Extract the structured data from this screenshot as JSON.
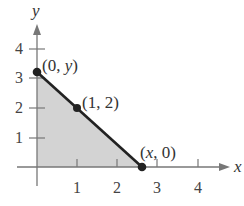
{
  "diagram": {
    "axes": {
      "x_label": "x",
      "y_label": "y",
      "x_ticks": [
        "1",
        "2",
        "3",
        "4"
      ],
      "y_ticks": [
        "1",
        "2",
        "3",
        "4"
      ]
    },
    "points": [
      {
        "label_pre": "(0, ",
        "label_var": "y",
        "label_post": ")",
        "x": 0,
        "y": 3.2
      },
      {
        "label": "(1, 2)",
        "x": 1,
        "y": 2
      },
      {
        "label_pre": "(",
        "label_var": "x",
        "label_post": ", 0)",
        "x": 2.67,
        "y": 0
      }
    ],
    "colors": {
      "shade": "#d3d3d3",
      "line": "#222222",
      "axis": "#777777"
    }
  }
}
